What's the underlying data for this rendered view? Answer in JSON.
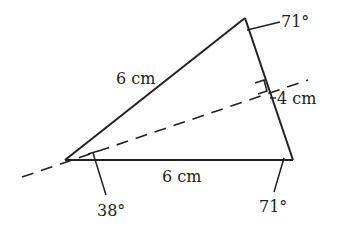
{
  "diagram": {
    "type": "isosceles-triangle",
    "vertices": {
      "A": {
        "x": 65,
        "y": 160
      },
      "B": {
        "x": 245,
        "y": 18
      },
      "C": {
        "x": 293,
        "y": 160
      }
    },
    "labels": {
      "side_AB": "6 cm",
      "side_AC": "6 cm",
      "perpendicular": "4 cm",
      "angle_B": "71°",
      "angle_C": "71°",
      "angle_A_half": "38°"
    },
    "colors": {
      "line": "#222222",
      "background": "#ffffff"
    }
  }
}
